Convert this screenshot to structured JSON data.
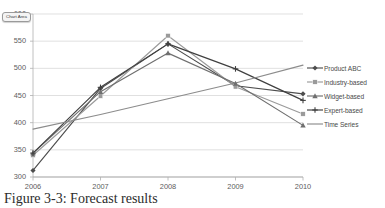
{
  "tooltip": {
    "label": "Chart Area"
  },
  "caption": {
    "text": "Figure 3-3: Forecast results"
  },
  "chart_data": {
    "type": "line",
    "title": "",
    "xlabel": "",
    "ylabel": "",
    "categories": [
      "2006",
      "2007",
      "2008",
      "2009",
      "2010"
    ],
    "x": [
      2006,
      2007,
      2008,
      2009,
      2010
    ],
    "ylim": [
      300,
      600
    ],
    "yticks": [
      300,
      350,
      400,
      450,
      500,
      550,
      600
    ],
    "ytick_labels": [
      "300",
      "350",
      "400",
      "450",
      "500",
      "550",
      "600"
    ],
    "grid": true,
    "grid_axis": "y",
    "legend_position": "right",
    "series": [
      {
        "name": "Product ABC",
        "values": [
          312,
          463,
          545,
          468,
          453
        ],
        "color": "#4d4d4d",
        "marker": "diamond"
      },
      {
        "name": "Industry-based",
        "values": [
          340,
          449,
          560,
          466,
          416
        ],
        "color": "#9a9a9a",
        "marker": "square"
      },
      {
        "name": "Widget-based",
        "values": [
          344,
          457,
          528,
          472,
          395
        ],
        "color": "#6f6f6f",
        "marker": "triangle"
      },
      {
        "name": "Expert-based",
        "values": [
          344,
          465,
          545,
          499,
          441
        ],
        "color": "#3f3f3f",
        "marker": "cross"
      },
      {
        "name": "Time Series",
        "values": [
          388,
          415,
          444,
          473,
          506
        ],
        "color": "#8c8c8c",
        "marker": "none"
      }
    ]
  }
}
